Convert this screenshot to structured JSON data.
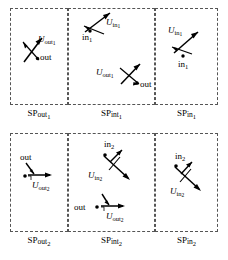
{
  "figure": {
    "rows": [
      {
        "row_id": "row-1",
        "panels": [
          {
            "id": "sp-out-1",
            "caption_base": "SP",
            "caption_sub": "out",
            "caption_subsub": "1",
            "items": [
              {
                "kind": "vector-label",
                "base": "U",
                "sub": "out",
                "subsub": "1"
              },
              {
                "kind": "point-label",
                "text": "out"
              }
            ]
          },
          {
            "id": "sp-int-1",
            "caption_base": "SP",
            "caption_sub": "int",
            "caption_subsub": "1",
            "items": [
              {
                "kind": "point-label",
                "base": "in",
                "sub": "1"
              },
              {
                "kind": "vector-label",
                "base": "U",
                "sub": "in",
                "subsub": "1"
              },
              {
                "kind": "vector-label",
                "base": "U",
                "sub": "out",
                "subsub": "1"
              },
              {
                "kind": "point-label",
                "text": "out"
              }
            ]
          },
          {
            "id": "sp-in-1",
            "caption_base": "SP",
            "caption_sub": "in",
            "caption_subsub": "1",
            "items": [
              {
                "kind": "vector-label",
                "base": "U",
                "sub": "in",
                "subsub": "1"
              },
              {
                "kind": "point-label",
                "base": "in",
                "sub": "1"
              }
            ]
          }
        ]
      },
      {
        "row_id": "row-2",
        "panels": [
          {
            "id": "sp-out-2",
            "caption_base": "SP",
            "caption_sub": "out",
            "caption_subsub": "2",
            "items": [
              {
                "kind": "point-label",
                "text": "out"
              },
              {
                "kind": "vector-label",
                "base": "U",
                "sub": "out",
                "subsub": "2"
              }
            ]
          },
          {
            "id": "sp-int-2",
            "caption_base": "SP",
            "caption_sub": "int",
            "caption_subsub": "2",
            "items": [
              {
                "kind": "point-label",
                "base": "in",
                "sub": "2"
              },
              {
                "kind": "vector-label",
                "base": "U",
                "sub": "in",
                "subsub": "2"
              },
              {
                "kind": "point-label",
                "text": "out"
              },
              {
                "kind": "vector-label",
                "base": "U",
                "sub": "out",
                "subsub": "2"
              }
            ]
          },
          {
            "id": "sp-in-2",
            "caption_base": "SP",
            "caption_sub": "in",
            "caption_subsub": "2",
            "items": [
              {
                "kind": "point-label",
                "base": "in",
                "sub": "2"
              },
              {
                "kind": "vector-label",
                "base": "U",
                "sub": "in",
                "subsub": "2"
              }
            ]
          }
        ]
      }
    ]
  },
  "labels": {
    "U": "U",
    "SP": "SP",
    "out": "out",
    "in": "in",
    "one": "1",
    "two": "2",
    "int": "int"
  },
  "captions": {
    "r1c1": {
      "base": "SP",
      "sub": "out",
      "idx": "1"
    },
    "r1c2": {
      "base": "SP",
      "sub": "int",
      "idx": "1"
    },
    "r1c3": {
      "base": "SP",
      "sub": "in",
      "idx": "1"
    },
    "r2c1": {
      "base": "SP",
      "sub": "out",
      "idx": "2"
    },
    "r2c2": {
      "base": "SP",
      "sub": "int",
      "idx": "2"
    },
    "r2c3": {
      "base": "SP",
      "sub": "in",
      "idx": "2"
    }
  },
  "vector_labels": {
    "r1c1_U": {
      "base": "U",
      "sub": "out",
      "idx": "1"
    },
    "r1c1_point": {
      "text": "out"
    },
    "r1c2_inpt": {
      "base": "in",
      "idx": "1"
    },
    "r1c2_Uin": {
      "base": "U",
      "sub": "in",
      "idx": "1"
    },
    "r1c2_Uout": {
      "base": "U",
      "sub": "out",
      "idx": "1"
    },
    "r1c2_outpt": {
      "text": "out"
    },
    "r1c3_Uin": {
      "base": "U",
      "sub": "in",
      "idx": "1"
    },
    "r1c3_inpt": {
      "base": "in",
      "idx": "1"
    },
    "r2c1_outpt": {
      "text": "out"
    },
    "r2c1_Uout": {
      "base": "U",
      "sub": "out",
      "idx": "2"
    },
    "r2c2_inpt": {
      "base": "in",
      "idx": "2"
    },
    "r2c2_Uin": {
      "base": "U",
      "sub": "in",
      "idx": "2"
    },
    "r2c2_outpt": {
      "text": "out"
    },
    "r2c2_Uout": {
      "base": "U",
      "sub": "out",
      "idx": "2"
    },
    "r2c3_inpt": {
      "base": "in",
      "idx": "2"
    },
    "r2c3_Uin": {
      "base": "U",
      "sub": "in",
      "idx": "2"
    }
  },
  "colors": {
    "panel_border": "#555555",
    "ink": "#000000",
    "background": "#ffffff"
  }
}
